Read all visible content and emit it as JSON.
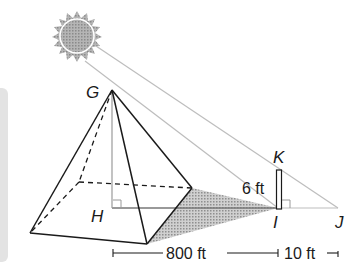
{
  "diagram": {
    "type": "geometry-figure",
    "colors": {
      "line": "#1a1a1a",
      "ray": "#bdbdbd",
      "sun_fill": "#a9a9a9",
      "shadow_fill": "#b8b8b8",
      "panel": "#e3e3e3"
    },
    "points": {
      "G": {
        "label": "G",
        "x": 112,
        "y": 90
      },
      "H": {
        "label": "H",
        "x": 112,
        "y": 208
      },
      "I": {
        "label": "I",
        "x": 278,
        "y": 208
      },
      "J": {
        "label": "J",
        "x": 338,
        "y": 208
      },
      "K": {
        "label": "K",
        "x": 280,
        "y": 170
      }
    },
    "labels": {
      "G": "G",
      "H": "H",
      "I": "I",
      "J": "J",
      "K": "K",
      "pole_height": "6 ft",
      "pyramid_shadow_length": "800 ft",
      "pole_shadow_length": "10 ft"
    }
  }
}
